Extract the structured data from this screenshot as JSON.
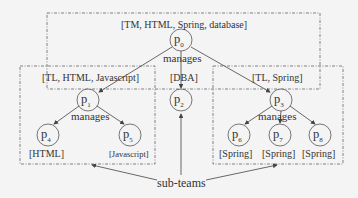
{
  "top_team": {
    "skills": "[TM, HTML, Spring, database]",
    "node": "p",
    "sub": "0",
    "edge_label": "manages"
  },
  "left_team": {
    "skills": "[TL, HTML, Javascript]",
    "node": "p",
    "sub": "1",
    "edge_label": "manages"
  },
  "middle": {
    "skills": "[DBA]",
    "node": "p",
    "sub": "2"
  },
  "right_team": {
    "skills": "[TL, Spring]",
    "node": "p",
    "sub": "3",
    "edge_label": "manages"
  },
  "leaves": [
    {
      "node": "p",
      "sub": "4",
      "skills": "[HTML]"
    },
    {
      "node": "p",
      "sub": "5",
      "skills": "[Javascript]"
    },
    {
      "node": "p",
      "sub": "6",
      "skills": "[Spring]"
    },
    {
      "node": "p",
      "sub": "7",
      "skills": "[Spring]"
    },
    {
      "node": "p",
      "sub": "8",
      "skills": "[Spring]"
    }
  ],
  "annotation": "sub-teams"
}
